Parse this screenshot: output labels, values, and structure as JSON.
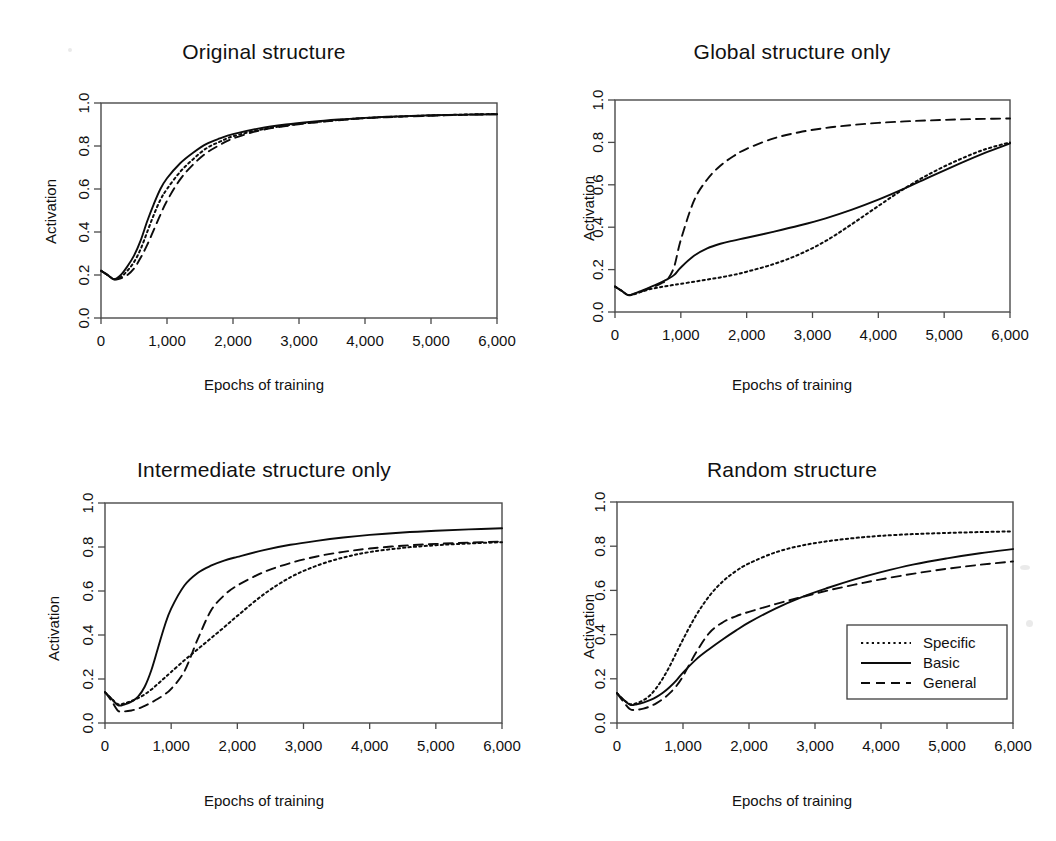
{
  "figure": {
    "background_color": "#ffffff",
    "line_color": "#0c0c0c",
    "axis_color": "#4a4a4a",
    "panel_count": 4
  },
  "legend": {
    "position": "bottom-right of Random structure panel",
    "entries": [
      {
        "label": "Specific",
        "style": "dotted"
      },
      {
        "label": "Basic",
        "style": "solid"
      },
      {
        "label": "General",
        "style": "dashed"
      }
    ]
  },
  "common": {
    "xlabel": "Epochs of training",
    "ylabel": "Activation",
    "xticks": [
      0,
      1000,
      2000,
      3000,
      4000,
      5000,
      6000
    ],
    "xticklabels": [
      "0",
      "1,000",
      "2,000",
      "3,000",
      "4,000",
      "5,000",
      "6,000"
    ],
    "yticks": [
      0.0,
      0.2,
      0.4,
      0.6,
      0.8,
      1.0
    ],
    "yticklabels": [
      "0.0",
      "0.2",
      "0.4",
      "0.6",
      "0.8",
      "1.0"
    ],
    "xlim": [
      0,
      6000
    ],
    "ylim": [
      0.0,
      1.0
    ],
    "grid": false
  },
  "chart_data": [
    {
      "type": "line",
      "panel_index": 0,
      "title": "Original structure",
      "xlabel": "Epochs of training",
      "ylabel": "Activation",
      "xlim": [
        0,
        6000
      ],
      "ylim": [
        0.0,
        1.0
      ],
      "xticks": [
        0,
        1000,
        2000,
        3000,
        4000,
        5000,
        6000
      ],
      "yticks": [
        0.0,
        0.2,
        0.4,
        0.6,
        0.8,
        1.0
      ],
      "grid": false,
      "x": [
        0,
        100,
        200,
        300,
        400,
        500,
        600,
        700,
        800,
        900,
        1000,
        1200,
        1400,
        1600,
        1800,
        2000,
        2400,
        2800,
        3200,
        3600,
        4000,
        4500,
        5000,
        5500,
        6000
      ],
      "series": [
        {
          "name": "Specific",
          "style": "dotted",
          "values": [
            0.22,
            0.2,
            0.18,
            0.19,
            0.22,
            0.26,
            0.32,
            0.4,
            0.48,
            0.55,
            0.6,
            0.68,
            0.74,
            0.79,
            0.82,
            0.845,
            0.875,
            0.895,
            0.91,
            0.921,
            0.93,
            0.937,
            0.942,
            0.946,
            0.949
          ]
        },
        {
          "name": "Basic",
          "style": "solid",
          "values": [
            0.22,
            0.2,
            0.18,
            0.2,
            0.24,
            0.29,
            0.36,
            0.45,
            0.53,
            0.6,
            0.65,
            0.72,
            0.77,
            0.81,
            0.835,
            0.855,
            0.882,
            0.9,
            0.913,
            0.923,
            0.931,
            0.938,
            0.943,
            0.946,
            0.948
          ]
        },
        {
          "name": "General",
          "style": "dashed",
          "values": [
            0.22,
            0.2,
            0.18,
            0.185,
            0.2,
            0.23,
            0.28,
            0.34,
            0.41,
            0.48,
            0.545,
            0.645,
            0.715,
            0.768,
            0.805,
            0.835,
            0.872,
            0.893,
            0.908,
            0.92,
            0.929,
            0.936,
            0.941,
            0.945,
            0.948
          ]
        }
      ]
    },
    {
      "type": "line",
      "panel_index": 1,
      "title": "Global structure only",
      "xlabel": "Epochs of training",
      "ylabel": "Activation",
      "xlim": [
        0,
        6000
      ],
      "ylim": [
        0.0,
        1.0
      ],
      "xticks": [
        0,
        1000,
        2000,
        3000,
        4000,
        5000,
        6000
      ],
      "yticks": [
        0.0,
        0.2,
        0.4,
        0.6,
        0.8,
        1.0
      ],
      "grid": false,
      "x": [
        0,
        100,
        200,
        300,
        400,
        500,
        600,
        700,
        800,
        900,
        1000,
        1200,
        1400,
        1600,
        1800,
        2000,
        2400,
        2800,
        3200,
        3600,
        4000,
        4400,
        4800,
        5200,
        5600,
        6000
      ],
      "series": [
        {
          "name": "Specific",
          "style": "dotted",
          "values": [
            0.12,
            0.1,
            0.08,
            0.085,
            0.095,
            0.105,
            0.112,
            0.118,
            0.123,
            0.128,
            0.133,
            0.143,
            0.153,
            0.163,
            0.175,
            0.19,
            0.225,
            0.272,
            0.335,
            0.415,
            0.5,
            0.583,
            0.655,
            0.715,
            0.765,
            0.8
          ]
        },
        {
          "name": "Basic",
          "style": "solid",
          "values": [
            0.12,
            0.1,
            0.08,
            0.088,
            0.1,
            0.113,
            0.126,
            0.14,
            0.155,
            0.175,
            0.21,
            0.265,
            0.3,
            0.322,
            0.337,
            0.35,
            0.378,
            0.408,
            0.442,
            0.483,
            0.53,
            0.583,
            0.64,
            0.695,
            0.748,
            0.795
          ]
        },
        {
          "name": "General",
          "style": "dashed",
          "values": [
            0.12,
            0.1,
            0.08,
            0.086,
            0.096,
            0.108,
            0.12,
            0.135,
            0.155,
            0.215,
            0.34,
            0.525,
            0.625,
            0.69,
            0.735,
            0.77,
            0.818,
            0.848,
            0.868,
            0.882,
            0.892,
            0.899,
            0.904,
            0.908,
            0.911,
            0.913
          ]
        }
      ]
    },
    {
      "type": "line",
      "panel_index": 2,
      "title": "Intermediate structure only",
      "xlabel": "Epochs of training",
      "ylabel": "Activation",
      "xlim": [
        0,
        6000
      ],
      "ylim": [
        0.0,
        1.0
      ],
      "xticks": [
        0,
        1000,
        2000,
        3000,
        4000,
        5000,
        6000
      ],
      "yticks": [
        0.0,
        0.2,
        0.4,
        0.6,
        0.8,
        1.0
      ],
      "grid": false,
      "x": [
        0,
        100,
        200,
        300,
        400,
        500,
        600,
        700,
        800,
        900,
        1000,
        1200,
        1400,
        1600,
        1800,
        2000,
        2400,
        2800,
        3200,
        3600,
        4000,
        4500,
        5000,
        5500,
        6000
      ],
      "series": [
        {
          "name": "Specific",
          "style": "dotted",
          "values": [
            0.14,
            0.11,
            0.085,
            0.09,
            0.1,
            0.113,
            0.13,
            0.152,
            0.178,
            0.205,
            0.232,
            0.285,
            0.335,
            0.385,
            0.435,
            0.487,
            0.585,
            0.662,
            0.715,
            0.752,
            0.777,
            0.796,
            0.808,
            0.816,
            0.822
          ]
        },
        {
          "name": "Basic",
          "style": "solid",
          "values": [
            0.14,
            0.11,
            0.08,
            0.085,
            0.097,
            0.12,
            0.165,
            0.24,
            0.34,
            0.44,
            0.52,
            0.625,
            0.682,
            0.715,
            0.738,
            0.755,
            0.786,
            0.81,
            0.828,
            0.843,
            0.855,
            0.866,
            0.874,
            0.88,
            0.885
          ]
        },
        {
          "name": "General",
          "style": "dashed",
          "values": [
            0.14,
            0.1,
            0.055,
            0.053,
            0.057,
            0.065,
            0.078,
            0.093,
            0.11,
            0.13,
            0.155,
            0.235,
            0.38,
            0.51,
            0.58,
            0.625,
            0.686,
            0.727,
            0.757,
            0.778,
            0.793,
            0.806,
            0.814,
            0.82,
            0.825
          ]
        }
      ]
    },
    {
      "type": "line",
      "panel_index": 3,
      "title": "Random structure",
      "xlabel": "Epochs of training",
      "ylabel": "Activation",
      "xlim": [
        0,
        6000
      ],
      "ylim": [
        0.0,
        1.0
      ],
      "xticks": [
        0,
        1000,
        2000,
        3000,
        4000,
        5000,
        6000
      ],
      "yticks": [
        0.0,
        0.2,
        0.4,
        0.6,
        0.8,
        1.0
      ],
      "grid": false,
      "x": [
        0,
        100,
        200,
        300,
        400,
        500,
        600,
        700,
        800,
        900,
        1000,
        1200,
        1400,
        1600,
        1800,
        2000,
        2400,
        2800,
        3200,
        3600,
        4000,
        4500,
        5000,
        5500,
        6000
      ],
      "series": [
        {
          "name": "Specific",
          "style": "dotted",
          "values": [
            0.135,
            0.105,
            0.085,
            0.09,
            0.103,
            0.125,
            0.16,
            0.205,
            0.258,
            0.318,
            0.378,
            0.488,
            0.575,
            0.64,
            0.687,
            0.722,
            0.772,
            0.803,
            0.823,
            0.837,
            0.847,
            0.855,
            0.86,
            0.864,
            0.867
          ]
        },
        {
          "name": "Basic",
          "style": "solid",
          "values": [
            0.135,
            0.105,
            0.082,
            0.085,
            0.092,
            0.103,
            0.118,
            0.138,
            0.163,
            0.193,
            0.228,
            0.288,
            0.335,
            0.378,
            0.418,
            0.455,
            0.518,
            0.57,
            0.612,
            0.65,
            0.683,
            0.718,
            0.745,
            0.768,
            0.787
          ]
        },
        {
          "name": "General",
          "style": "dashed",
          "values": [
            0.135,
            0.095,
            0.062,
            0.06,
            0.065,
            0.075,
            0.09,
            0.11,
            0.135,
            0.168,
            0.212,
            0.32,
            0.408,
            0.455,
            0.483,
            0.503,
            0.538,
            0.57,
            0.6,
            0.626,
            0.65,
            0.676,
            0.698,
            0.716,
            0.731
          ]
        }
      ]
    }
  ]
}
